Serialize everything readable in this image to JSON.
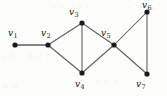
{
  "figure": {
    "kind": "undirected-graph-diagram",
    "width": 167,
    "height": 96,
    "background_color": "#fdfdfc",
    "edge_color": "#5d5d5d",
    "vertex_color": "#1b1b1b",
    "label_color": "#151515"
  },
  "background_artifacts": [
    {
      "id": "bleed-a",
      "text": "v v v v v"
    },
    {
      "id": "bleed-b",
      "text": "a b c d e f g"
    },
    {
      "id": "bleed-c",
      "text": "x y z"
    },
    {
      "id": "bleed-d",
      "text": "m n"
    }
  ],
  "graph": {
    "vertices": [
      {
        "id": "v1",
        "name": "v",
        "sub": "1",
        "x": 15,
        "y": 45,
        "label_x": 8,
        "label_y": 29
      },
      {
        "id": "v2",
        "name": "v",
        "sub": "2",
        "x": 48,
        "y": 45,
        "label_x": 41,
        "label_y": 29
      },
      {
        "id": "v3",
        "name": "v",
        "sub": "3",
        "x": 82,
        "y": 23,
        "label_x": 69,
        "label_y": 8
      },
      {
        "id": "v4",
        "name": "v",
        "sub": "4",
        "x": 82,
        "y": 73,
        "label_x": 75,
        "label_y": 80
      },
      {
        "id": "v5",
        "name": "v",
        "sub": "5",
        "x": 114,
        "y": 45,
        "label_x": 101,
        "label_y": 29
      },
      {
        "id": "v6",
        "name": "v",
        "sub": "6",
        "x": 147,
        "y": 12,
        "label_x": 142,
        "label_y": 1
      },
      {
        "id": "v7",
        "name": "v",
        "sub": "7",
        "x": 147,
        "y": 74,
        "label_x": 136,
        "label_y": 80
      }
    ],
    "vertex_radius": 2.6,
    "edges": [
      {
        "id": "e-v1-v2",
        "from": "v1",
        "to": "v2",
        "weight": "thick"
      },
      {
        "id": "e-v2-v3",
        "from": "v2",
        "to": "v3",
        "weight": "normal"
      },
      {
        "id": "e-v2-v4",
        "from": "v2",
        "to": "v4",
        "weight": "normal"
      },
      {
        "id": "e-v3-v4",
        "from": "v3",
        "to": "v4",
        "weight": "normal"
      },
      {
        "id": "e-v3-v5",
        "from": "v3",
        "to": "v5",
        "weight": "normal"
      },
      {
        "id": "e-v4-v5",
        "from": "v4",
        "to": "v5",
        "weight": "normal"
      },
      {
        "id": "e-v5-v6",
        "from": "v5",
        "to": "v6",
        "weight": "normal"
      },
      {
        "id": "e-v5-v7",
        "from": "v5",
        "to": "v7",
        "weight": "normal"
      },
      {
        "id": "e-v6-v7",
        "from": "v6",
        "to": "v7",
        "weight": "normal"
      }
    ]
  }
}
